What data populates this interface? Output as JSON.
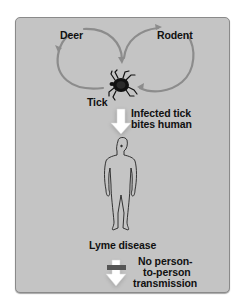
{
  "diagram": {
    "nodes": {
      "deer": "Deer",
      "rodent": "Rodent",
      "tick": "Tick",
      "human_outcome": "Lyme disease"
    },
    "edges": {
      "tick_to_human": {
        "line1": "Infected tick",
        "line2": "bites human"
      },
      "no_transmission": {
        "line1": "No person-",
        "line2": "to-person",
        "line3": "transmission"
      }
    },
    "colors": {
      "panel": "#c4c4c4",
      "cycle_arrow": "#8c8c8c",
      "block_bar": "#555555",
      "text": "#111111"
    }
  }
}
